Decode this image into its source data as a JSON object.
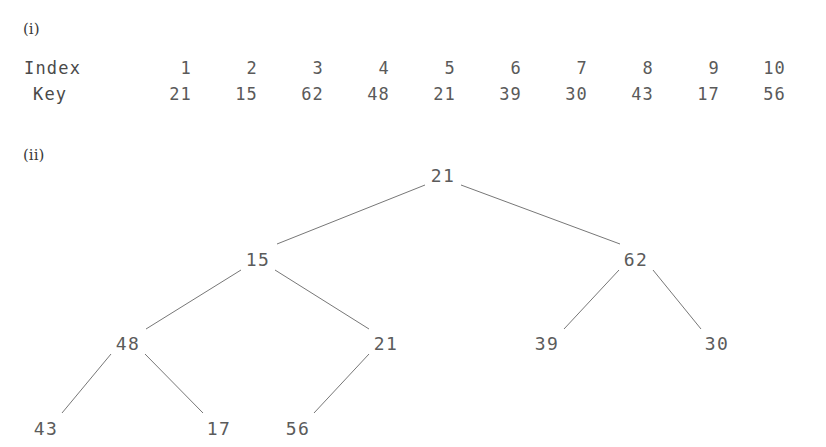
{
  "figure": {
    "parts": [
      {
        "id": "i",
        "label": "(i)"
      },
      {
        "id": "ii",
        "label": "(ii)"
      }
    ]
  },
  "table": {
    "row_headers": {
      "index": "Index",
      "key": "Key"
    },
    "columns": [
      {
        "index": "1",
        "key": "21"
      },
      {
        "index": "2",
        "key": "15"
      },
      {
        "index": "3",
        "key": "62"
      },
      {
        "index": "4",
        "key": "48"
      },
      {
        "index": "5",
        "key": "21"
      },
      {
        "index": "6",
        "key": "39"
      },
      {
        "index": "7",
        "key": "30"
      },
      {
        "index": "8",
        "key": "43"
      },
      {
        "index": "9",
        "key": "17"
      },
      {
        "index": "10",
        "key": "56"
      }
    ]
  },
  "tree": {
    "nodes": [
      {
        "name": "root",
        "label": "21",
        "x": 443,
        "y": 178
      },
      {
        "name": "level1-left",
        "label": "15",
        "x": 258,
        "y": 262
      },
      {
        "name": "level1-right",
        "label": "62",
        "x": 636,
        "y": 262
      },
      {
        "name": "level2-a",
        "label": "48",
        "x": 128,
        "y": 346
      },
      {
        "name": "level2-b",
        "label": "21",
        "x": 386,
        "y": 346
      },
      {
        "name": "level2-c",
        "label": "39",
        "x": 547,
        "y": 346
      },
      {
        "name": "level2-d",
        "label": "30",
        "x": 717,
        "y": 346
      },
      {
        "name": "level3-a",
        "label": "43",
        "x": 46,
        "y": 431
      },
      {
        "name": "level3-b",
        "label": "17",
        "x": 219,
        "y": 431
      },
      {
        "name": "level3-c",
        "label": "56",
        "x": 298,
        "y": 431
      }
    ],
    "edges": [
      {
        "name": "edge-root-15",
        "x1": 425,
        "y1": 185,
        "x2": 277,
        "y2": 244
      },
      {
        "name": "edge-root-62",
        "x1": 461,
        "y1": 185,
        "x2": 620,
        "y2": 244
      },
      {
        "name": "edge-15-48",
        "x1": 241,
        "y1": 270,
        "x2": 146,
        "y2": 329
      },
      {
        "name": "edge-15-21",
        "x1": 275,
        "y1": 270,
        "x2": 369,
        "y2": 329
      },
      {
        "name": "edge-48-43",
        "x1": 111,
        "y1": 354,
        "x2": 62,
        "y2": 413
      },
      {
        "name": "edge-48-17",
        "x1": 145,
        "y1": 354,
        "x2": 203,
        "y2": 413
      },
      {
        "name": "edge-21-56",
        "x1": 369,
        "y1": 354,
        "x2": 314,
        "y2": 413
      },
      {
        "name": "edge-62-39",
        "x1": 619,
        "y1": 270,
        "x2": 564,
        "y2": 329
      },
      {
        "name": "edge-62-30",
        "x1": 653,
        "y1": 270,
        "x2": 701,
        "y2": 329
      }
    ],
    "line_color": "#777777"
  }
}
